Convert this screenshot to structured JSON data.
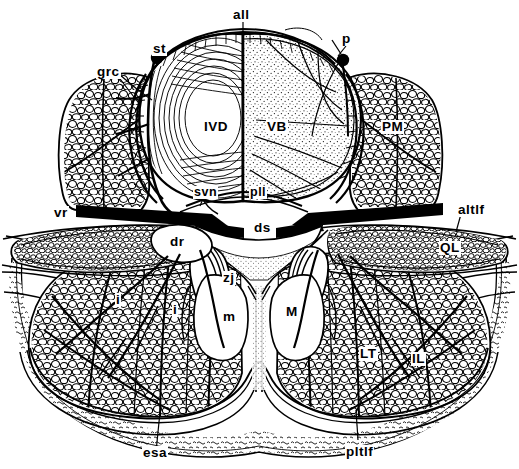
{
  "figure": {
    "kind": "anatomical-cross-section",
    "background_color": "#ffffff",
    "ink_color": "#000000",
    "width": 519,
    "height": 469
  },
  "labels": [
    {
      "id": "all",
      "text": "all",
      "x": 232,
      "y": 8,
      "size": "sz-lg",
      "role": "anterior-longitudinal-ligament"
    },
    {
      "id": "st",
      "text": "st",
      "x": 152,
      "y": 42,
      "size": "sz-lg",
      "role": "sympathetic-trunk"
    },
    {
      "id": "p",
      "text": "p",
      "x": 341,
      "y": 32,
      "size": "sz-lg",
      "role": "periosteum"
    },
    {
      "id": "grc",
      "text": "grc",
      "x": 96,
      "y": 65,
      "size": "sz-lg",
      "role": "grey-ramus-communicans"
    },
    {
      "id": "IVD",
      "text": "IVD",
      "x": 203,
      "y": 120,
      "size": "sz-lg",
      "role": "intervertebral-disc"
    },
    {
      "id": "VB",
      "text": "VB",
      "x": 266,
      "y": 120,
      "size": "sz-lg",
      "role": "vertebral-body"
    },
    {
      "id": "PM",
      "text": "PM",
      "x": 381,
      "y": 120,
      "size": "sz-lg",
      "role": "psoas-major"
    },
    {
      "id": "r",
      "text": "r",
      "x": 144,
      "y": 186,
      "size": "sz-tiny",
      "role": "radicular-branch"
    },
    {
      "id": "svn",
      "text": "svn",
      "x": 193,
      "y": 186,
      "size": "sz-md",
      "role": "sinuvertebral-nerve"
    },
    {
      "id": "pll",
      "text": "pll",
      "x": 249,
      "y": 186,
      "size": "sz-md",
      "role": "posterior-longitudinal-ligament"
    },
    {
      "id": "vr",
      "text": "vr",
      "x": 53,
      "y": 206,
      "size": "sz-lg",
      "role": "ventral-ramus"
    },
    {
      "id": "altlf",
      "text": "altlf",
      "x": 457,
      "y": 203,
      "size": "sz-lg",
      "role": "anterior-layer-thoracolumbar-fascia"
    },
    {
      "id": "ds",
      "text": "ds",
      "x": 253,
      "y": 221,
      "size": "sz-lg",
      "role": "dural-sac"
    },
    {
      "id": "dr",
      "text": "dr",
      "x": 169,
      "y": 235,
      "size": "sz-lg",
      "role": "dorsal-ramus"
    },
    {
      "id": "QL",
      "text": "QL",
      "x": 439,
      "y": 241,
      "size": "sz-lg",
      "role": "quadratus-lumborum"
    },
    {
      "id": "zj",
      "text": "zj",
      "x": 222,
      "y": 271,
      "size": "sz-lg",
      "role": "zygapophysial-joint"
    },
    {
      "id": "i-left",
      "text": "i",
      "x": 115,
      "y": 293,
      "size": "sz-lg",
      "role": "intermediate-branch-left"
    },
    {
      "id": "i-mid",
      "text": "i",
      "x": 172,
      "y": 303,
      "size": "sz-lg",
      "role": "intermediate-branch-medial"
    },
    {
      "id": "m",
      "text": "m",
      "x": 222,
      "y": 310,
      "size": "sz-lg",
      "role": "medial-branch"
    },
    {
      "id": "M",
      "text": "M",
      "x": 285,
      "y": 305,
      "size": "sz-lg",
      "role": "multifidus"
    },
    {
      "id": "LT",
      "text": "LT",
      "x": 359,
      "y": 347,
      "size": "sz-lg",
      "role": "longissimus-thoracis"
    },
    {
      "id": "IL",
      "text": "IL",
      "x": 411,
      "y": 352,
      "size": "sz-lg",
      "role": "iliocostalis-lumborum"
    },
    {
      "id": "esa",
      "text": "esa",
      "x": 142,
      "y": 446,
      "size": "sz-lg",
      "role": "erector-spinae-aponeurosis"
    },
    {
      "id": "pltlf",
      "text": "pltlf",
      "x": 345,
      "y": 445,
      "size": "sz-lg",
      "role": "posterior-layer-thoracolumbar-fascia"
    }
  ],
  "legend_terms": {
    "all": "anterior longitudinal ligament",
    "st": "sympathetic trunk",
    "p": "periosteum",
    "grc": "grey ramus communicans",
    "IVD": "intervertebral disc",
    "VB": "vertebral body",
    "PM": "psoas major",
    "svn": "sinuvertebral nerve",
    "pll": "posterior longitudinal ligament",
    "vr": "ventral ramus",
    "altlf": "anterior layer of thoracolumbar fascia",
    "ds": "dural sac",
    "dr": "dorsal ramus",
    "QL": "quadratus lumborum",
    "zj": "zygapophysial joint",
    "m": "medial branch",
    "i": "intermediate branch",
    "M": "multifidus",
    "LT": "longissimus thoracis",
    "IL": "iliocostalis lumborum",
    "esa": "erector spinae aponeurosis",
    "pltlf": "posterior layer of thoracolumbar fascia"
  }
}
